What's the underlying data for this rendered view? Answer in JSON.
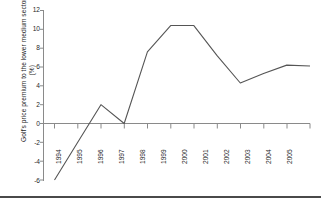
{
  "chart_data": {
    "type": "line",
    "title": "",
    "xlabel": "",
    "ylabel": "Golf's price premium to the lower medium sector (%)",
    "categories": [
      "1994",
      "1995",
      "1996",
      "1997",
      "1998",
      "1999",
      "2000",
      "2001",
      "2002",
      "2003",
      "2004",
      "2005"
    ],
    "x": [
      1994,
      1995,
      1996,
      1997,
      1998,
      1999,
      2000,
      2001,
      2002,
      2003,
      2004,
      2005
    ],
    "values": [
      -6.0,
      -2.0,
      2.0,
      0.0,
      7.6,
      10.4,
      10.4,
      7.2,
      4.3,
      5.3,
      6.2,
      6.1
    ],
    "series": [
      {
        "name": "Golf's price premium to the lower medium sector (%)",
        "values": [
          -6.0,
          -2.0,
          2.0,
          0.0,
          7.6,
          10.4,
          10.4,
          7.2,
          4.3,
          5.3,
          6.2,
          6.1
        ]
      }
    ],
    "ylim": [
      -6,
      12
    ],
    "yticks": [
      12,
      10,
      8,
      6,
      4,
      2,
      0,
      -2,
      -4,
      -6
    ],
    "ytick_labels": [
      "12",
      "10",
      "8",
      "6",
      "4",
      "2",
      "0",
      "-2",
      "-4",
      "-6"
    ],
    "grid": false,
    "legend": false,
    "legend_position": "none",
    "line_color": "#555555",
    "axis_color": "#808080",
    "background_color": "#ffffff"
  }
}
